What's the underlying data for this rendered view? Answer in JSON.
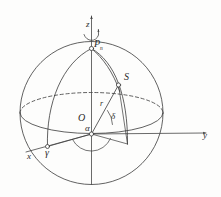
{
  "figure": {
    "background_color": "#fdfdfc",
    "ink_color": "#3a3a3a",
    "label_color": "#2b2b2b"
  },
  "axes": {
    "z": {
      "label": "z",
      "description": "vertical rotation axis of the sphere"
    },
    "x": {
      "label": "x",
      "description": "axis toward lower left"
    },
    "y": {
      "label": "y",
      "description": "axis toward lower right"
    }
  },
  "points": {
    "pole": {
      "label": "P",
      "subscript": "n",
      "description": "north celestial pole"
    },
    "star": {
      "label": "S",
      "description": "star position on the sphere"
    },
    "origin": {
      "label": "O",
      "description": "center of the celestial sphere"
    },
    "vernal_equinox": {
      "label": "γ",
      "description": "vernal equinox point on the equator"
    }
  },
  "measures": {
    "radius": {
      "label": "r",
      "description": "radius vector from O to S"
    },
    "declination": {
      "label": "δ",
      "description": "declination angle of the star above the equator"
    },
    "right_ascension": {
      "label": "α",
      "description": "right ascension angle measured from the vernal equinox"
    }
  },
  "annotations": {
    "rotation_arrow": "curved-rotation-arrow-about-z"
  }
}
